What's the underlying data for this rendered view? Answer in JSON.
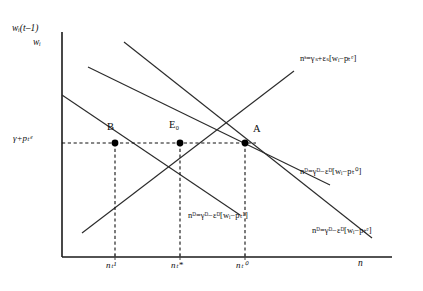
{
  "figure": {
    "axes": {
      "y_label_top": "wᵢ(t–1)",
      "y_label_bottom": "wᵢ",
      "x_label": "n",
      "y_tick_label": "γ+pₜᵉ",
      "x_tick_labels": [
        "nₜ¹",
        "nₜ*",
        "nₜ⁰"
      ]
    },
    "points": [
      {
        "name": "B",
        "label": "B",
        "x": 115,
        "y": 143
      },
      {
        "name": "E0",
        "label": "E₀",
        "x": 180,
        "y": 143
      },
      {
        "name": "A",
        "label": "A",
        "x": 245,
        "y": 143
      }
    ],
    "curves": [
      {
        "name": "supply-curve",
        "type": "supply",
        "label": "nˢ=γₛ+εₛ[wᵢ−pₜᵉ]",
        "slope": "positive"
      },
      {
        "name": "demand-curve-upper",
        "type": "demand",
        "label": "nᴰ=γᴰ−εᴰ[wᵢ−pₜ⁰]",
        "slope": "negative"
      },
      {
        "name": "demand-curve-lower",
        "type": "demand",
        "label": "nᴰ=γᴰ−εᴰ[wᵢ−pₜ¹]",
        "slope": "negative"
      },
      {
        "name": "demand-curve-outer",
        "type": "demand",
        "label": "nᴰ=γᴰ−εᴰ[wᵢ−pₜᵉ]",
        "slope": "negative"
      }
    ],
    "colors": {
      "line": "#2b2b2b",
      "axis": "#1a1a1a",
      "background": "#ffffff",
      "point": "#000000"
    }
  }
}
